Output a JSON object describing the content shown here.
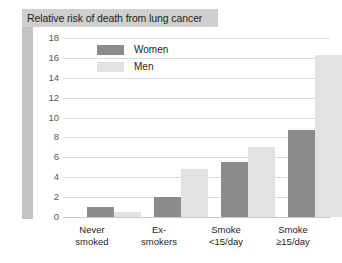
{
  "panel": {
    "title": "Relative risk of death from lung cancer"
  },
  "legend": {
    "position": "top-left-inside",
    "items": [
      {
        "label": "Women",
        "color": "#8c8c8c"
      },
      {
        "label": "Men",
        "color": "#e2e2e2"
      }
    ]
  },
  "colors": {
    "women_bar": "#8c8c8c",
    "men_bar": "#e2e2e2",
    "title_bar": "#cfcfcf",
    "axis_band": "#c3c3c3",
    "gridline": "#dcdcdc",
    "text": "#231f20",
    "tick_text": "#58595b"
  },
  "chart_data": {
    "type": "bar",
    "title": "Relative risk of death from lung cancer",
    "xlabel": "",
    "ylabel": "",
    "ylim": [
      0,
      18
    ],
    "yticks": [
      0,
      2,
      4,
      6,
      8,
      10,
      12,
      14,
      16,
      18
    ],
    "ytick_labels": [
      "0",
      "2",
      "4",
      "6",
      "8",
      "10",
      "12",
      "14",
      "16",
      "18"
    ],
    "grid": true,
    "legend_position": "upper left",
    "categories": [
      "Never smoked",
      "Ex-smokers",
      "Smoke <15/day",
      "Smoke ≥15/day"
    ],
    "category_lines": [
      [
        "Never",
        "smoked"
      ],
      [
        "Ex-",
        "smokers"
      ],
      [
        "Smoke",
        "<15/day"
      ],
      [
        "Smoke",
        "≥15/day"
      ]
    ],
    "series": [
      {
        "name": "Women",
        "color": "#8c8c8c",
        "values": [
          1.0,
          2.0,
          5.5,
          8.8
        ]
      },
      {
        "name": "Men",
        "color": "#e2e2e2",
        "values": [
          0.5,
          4.8,
          7.0,
          16.3
        ]
      }
    ]
  }
}
